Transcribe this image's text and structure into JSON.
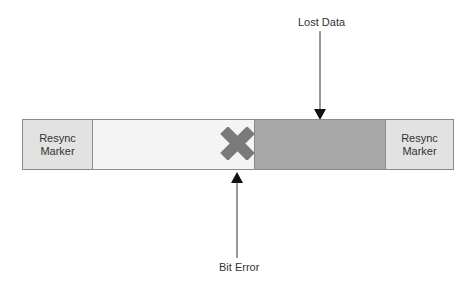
{
  "diagram": {
    "segments": [
      {
        "id": "resync-marker-left",
        "label_line1": "Resync",
        "label_line2": "Marker",
        "color": "#e2e2e2"
      },
      {
        "id": "received-data",
        "label": "",
        "color": "#f4f4f4"
      },
      {
        "id": "lost-data",
        "label": "",
        "color": "#a8a8a8"
      },
      {
        "id": "resync-marker-right",
        "label_line1": "Resync",
        "label_line2": "Marker",
        "color": "#e2e2e2"
      }
    ],
    "annotations": {
      "lost_data": "Lost Data",
      "bit_error": "Bit Error"
    },
    "error_icon": "x-mark-icon",
    "error_color": "#7a7a7a"
  }
}
